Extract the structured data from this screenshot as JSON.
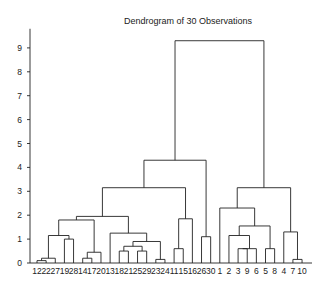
{
  "chart_data": {
    "type": "dendrogram",
    "title": "Dendrogram of 30 Observations",
    "xlabel": "",
    "ylabel": "",
    "ylim": [
      0,
      9.8
    ],
    "yticks": [
      0,
      1,
      2,
      3,
      4,
      5,
      6,
      7,
      8,
      9
    ],
    "grid": false,
    "leaf_order": [
      "12",
      "22",
      "27",
      "19",
      "28",
      "14",
      "17",
      "20",
      "13",
      "18",
      "21",
      "25",
      "29",
      "23",
      "24",
      "11",
      "15",
      "16",
      "26",
      "30",
      "1",
      "2",
      "3",
      "9",
      "6",
      "5",
      "8",
      "4",
      "7",
      "10"
    ],
    "merges": [
      {
        "left": "12",
        "right": "22",
        "height": 0.1
      },
      {
        "left": "12+22",
        "right": "27",
        "height": 0.2
      },
      {
        "left": "12+22+27",
        "right": "19",
        "height": 0.5
      },
      {
        "left": "19",
        "right": "28",
        "height": 1.0
      },
      {
        "left": "A",
        "right": "B",
        "height": 1.15
      },
      {
        "left": "14",
        "right": "17",
        "height": 0.2
      },
      {
        "left": "14+17",
        "right": "20",
        "height": 0.45
      },
      {
        "left": "left-sub",
        "right": "14-17-20",
        "height": 1.8
      },
      {
        "left": "18",
        "right": "21",
        "height": 0.5
      },
      {
        "left": "25",
        "right": "29",
        "height": 0.5
      },
      {
        "left": "18+21",
        "right": "25+29",
        "height": 0.7
      },
      {
        "left": "23",
        "right": "24",
        "height": 0.15
      },
      {
        "left": "18-29",
        "right": "23+24",
        "height": 0.9
      },
      {
        "left": "13",
        "right": "18-24",
        "height": 1.25
      },
      {
        "left": "left-group",
        "right": "13-24",
        "height": 1.8
      },
      {
        "left": "11",
        "right": "15",
        "height": 0.6
      },
      {
        "left": "16",
        "right": "11+15",
        "height": 1.85
      },
      {
        "left": "26",
        "right": "30",
        "height": 1.1
      },
      {
        "left": "1-28 group",
        "right": "11-16",
        "height": 3.15
      },
      {
        "left": "left-cluster",
        "right": "26+30",
        "height": 4.3
      },
      {
        "left": "3",
        "right": "9",
        "height": 0.6
      },
      {
        "left": "6",
        "right": "3+9",
        "height": 0.6
      },
      {
        "left": "5",
        "right": "8",
        "height": 0.6
      },
      {
        "left": "2",
        "right": "3-6",
        "height": 1.15
      },
      {
        "left": "2-6",
        "right": "5+8",
        "height": 1.55
      },
      {
        "left": "1",
        "right": "2-8",
        "height": 2.3
      },
      {
        "left": "7",
        "right": "10",
        "height": 0.15
      },
      {
        "left": "4",
        "right": "7+10",
        "height": 1.3
      },
      {
        "left": "1-8",
        "right": "4-10",
        "height": 3.15
      },
      {
        "left": "left-cluster",
        "right": "right-cluster",
        "height": 9.3
      }
    ]
  }
}
